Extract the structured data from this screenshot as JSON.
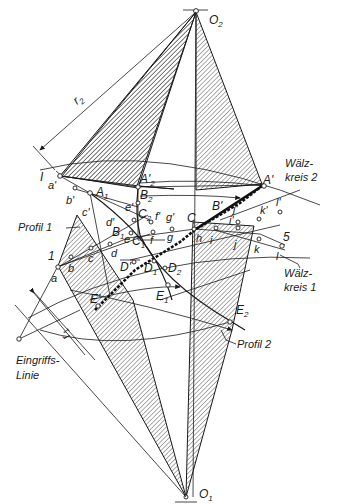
{
  "diagram": {
    "centers": {
      "top": {
        "label": "O",
        "sub": "2"
      },
      "bottom": {
        "label": "O",
        "sub": "1"
      }
    },
    "radii": {
      "r2": {
        "label": "r",
        "sub": "2"
      },
      "r1": {
        "label": "r",
        "sub": "1"
      }
    },
    "curve_labels": {
      "pitch_circle_2": [
        "Wälz-",
        "kreis 2"
      ],
      "pitch_circle_1": [
        "Wälz-",
        "kreis 1"
      ],
      "profile_1": "Profil 1",
      "profile_2": "Profil 2",
      "line_of_action": [
        "Eingriffs-",
        "Linie"
      ]
    },
    "point_labels": {
      "I": "I",
      "one": "1",
      "five": "5",
      "A_prime": "A'",
      "A1": "A",
      "A1_sub": "1",
      "A2p": "A'",
      "A2p_sub": "2",
      "B_prime": "B'",
      "B1": "B",
      "B1_sub": "1",
      "B2": "B",
      "B2_sub": "2",
      "C": "C",
      "C1": "C",
      "C1_sub": "1",
      "C2": "C",
      "C2_sub": "2",
      "D_prime": "D'",
      "D1": "D",
      "D1_sub": "1",
      "D2": "D",
      "D2_sub": "2",
      "E_prime": "E'",
      "E1": "E",
      "E1_sub": "1",
      "E2": "E",
      "E2_sub": "2",
      "a": "a",
      "b": "b",
      "c": "c",
      "d": "d",
      "e": "e",
      "f": "f",
      "g": "g",
      "h": "h",
      "i": "i",
      "j": "j",
      "k": "k",
      "l": "l",
      "a_p": "a'",
      "b_p": "b'",
      "c_p": "c'",
      "d_p": "d'",
      "e_p": "e'",
      "f_p": "f'",
      "g_p": "g'",
      "i_p": "i'",
      "j_p": "j'",
      "k_p": "k'",
      "l_p": "l'"
    },
    "colors": {
      "ink": "#1a1a1a",
      "paper": "#ffffff"
    }
  }
}
